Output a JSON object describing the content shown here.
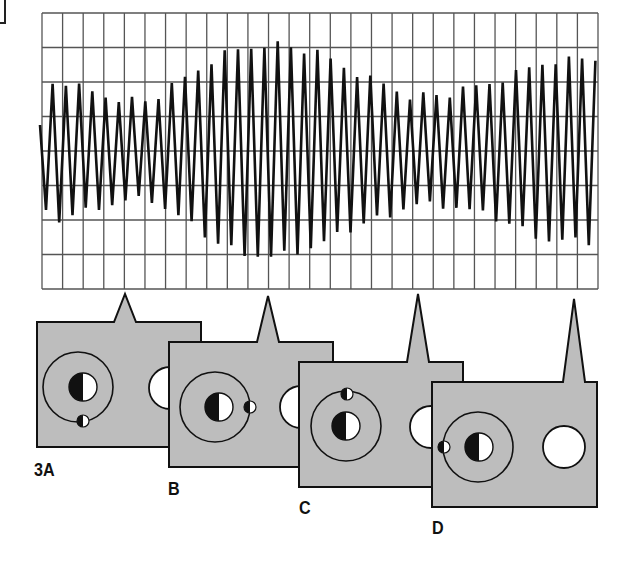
{
  "figure": {
    "id_label": "3A",
    "colors": {
      "background": "#ffffff",
      "grid": "#555555",
      "wave": "#111111",
      "card_fill": "#bdbdbd",
      "card_stroke": "#111111",
      "hole": "#ffffff",
      "planet_dark": "#111111",
      "planet_light": "#ffffff"
    }
  },
  "oscilloscope": {
    "x0": 42,
    "y0": 13,
    "x1": 598,
    "y1": 289,
    "cols": 27,
    "rows": 8,
    "midline_y": 150,
    "wave_start_x": 40,
    "wave_end_x": 596,
    "cycles": 42,
    "envelope": [
      {
        "x": 40,
        "amp": 62
      },
      {
        "x": 60,
        "amp": 70
      },
      {
        "x": 100,
        "amp": 55
      },
      {
        "x": 150,
        "amp": 48
      },
      {
        "x": 180,
        "amp": 68
      },
      {
        "x": 220,
        "amp": 95
      },
      {
        "x": 270,
        "amp": 108
      },
      {
        "x": 320,
        "amp": 95
      },
      {
        "x": 360,
        "amp": 75
      },
      {
        "x": 410,
        "amp": 55
      },
      {
        "x": 450,
        "amp": 55
      },
      {
        "x": 500,
        "amp": 70
      },
      {
        "x": 550,
        "amp": 90
      },
      {
        "x": 596,
        "amp": 92
      }
    ]
  },
  "panels": [
    {
      "label": "3A",
      "label_x": 34,
      "label_y": 459,
      "x": 37,
      "y": 322,
      "w": 164,
      "h": 125,
      "spike_x": 125,
      "spike_top": 294,
      "spike_half": 11,
      "orbit": {
        "cx": 78,
        "cy": 387,
        "r": 35
      },
      "planet": {
        "cx": 83,
        "cy": 387,
        "r": 14
      },
      "moon": {
        "cx": 83,
        "cy": 421,
        "r": 6
      },
      "hole": {
        "cx": 170,
        "cy": 388,
        "r": 21
      }
    },
    {
      "label": "B",
      "label_x": 168,
      "label_y": 478,
      "x": 169,
      "y": 342,
      "w": 164,
      "h": 125,
      "spike_x": 268,
      "spike_top": 296,
      "spike_half": 11,
      "orbit": {
        "cx": 215,
        "cy": 407,
        "r": 35
      },
      "planet": {
        "cx": 219,
        "cy": 407,
        "r": 14
      },
      "moon": {
        "cx": 250,
        "cy": 407,
        "r": 6
      },
      "hole": {
        "cx": 301,
        "cy": 407,
        "r": 21
      }
    },
    {
      "label": "C",
      "label_x": 299,
      "label_y": 497,
      "x": 299,
      "y": 362,
      "w": 164,
      "h": 125,
      "spike_x": 418,
      "spike_top": 294,
      "spike_half": 11,
      "orbit": {
        "cx": 346,
        "cy": 426,
        "r": 35
      },
      "planet": {
        "cx": 346,
        "cy": 426,
        "r": 14
      },
      "moon": {
        "cx": 347,
        "cy": 394,
        "r": 6
      },
      "hole": {
        "cx": 431,
        "cy": 427,
        "r": 21
      }
    },
    {
      "label": "D",
      "label_x": 432,
      "label_y": 517,
      "x": 432,
      "y": 382,
      "w": 165,
      "h": 125,
      "spike_x": 574,
      "spike_top": 299,
      "spike_half": 11,
      "orbit": {
        "cx": 478,
        "cy": 447,
        "r": 35
      },
      "planet": {
        "cx": 479,
        "cy": 447,
        "r": 14
      },
      "moon": {
        "cx": 444,
        "cy": 447,
        "r": 6
      },
      "hole": {
        "cx": 564,
        "cy": 447,
        "r": 21
      }
    }
  ]
}
